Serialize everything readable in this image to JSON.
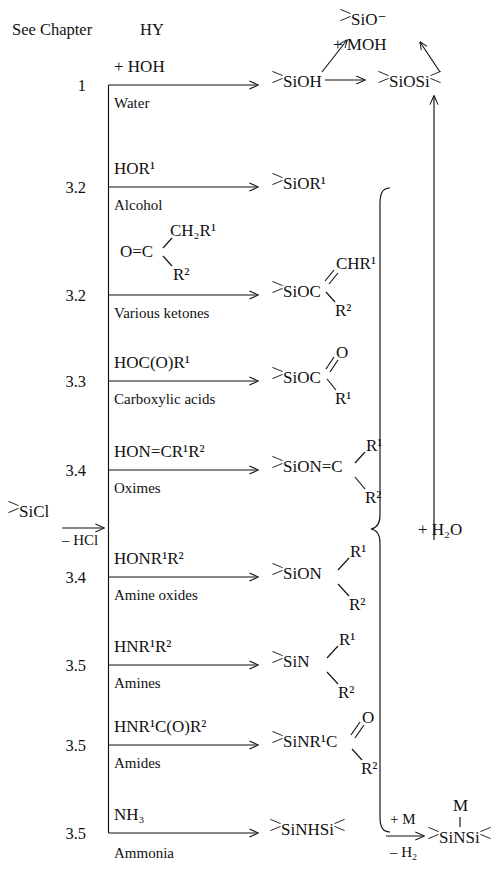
{
  "header": {
    "col_chapter": "See Chapter",
    "col_reagent": "HY"
  },
  "start": {
    "label_prefix": "SiCl",
    "byproduct": "– HCl"
  },
  "rows": [
    {
      "chapter": "1",
      "reagent": "+ HOH",
      "reagent_name": "Water",
      "product": "SiOH"
    },
    {
      "chapter": "3.2",
      "reagent": "HOR¹",
      "reagent_name": "Alcohol",
      "product": "SiOR¹"
    },
    {
      "chapter": "3.2",
      "reagent": "O=C",
      "reagent_top": "CH₂R¹",
      "reagent_bottom": "R²",
      "reagent_name": "Various ketones",
      "product": "SiOC",
      "product_top": "CHR¹",
      "product_bottom": "R²"
    },
    {
      "chapter": "3.3",
      "reagent": "HOC(O)R¹",
      "reagent_name": "Carboxylic acids",
      "product": "SiOC",
      "product_top": "O",
      "product_bottom": "R¹"
    },
    {
      "chapter": "3.4",
      "reagent": "HON=CR¹R²",
      "reagent_name": "Oximes",
      "product": "SiON=C",
      "product_top": "R¹",
      "product_bottom": "R²"
    },
    {
      "chapter": "3.4",
      "reagent": "HONR¹R²",
      "reagent_name": "Amine oxides",
      "product": "SiON",
      "product_top": "R¹",
      "product_bottom": "R²"
    },
    {
      "chapter": "3.5",
      "reagent": "HNR¹R²",
      "reagent_name": "Amines",
      "product": "SiN",
      "product_top": "R¹",
      "product_bottom": "R²"
    },
    {
      "chapter": "3.5",
      "reagent": "HNR¹C(O)R²",
      "reagent_name": "Amides",
      "product": "SiNR¹C",
      "product_top": "O",
      "product_bottom": "R²"
    },
    {
      "chapter": "3.5",
      "reagent": "NH₃",
      "reagent_name": "Ammonia",
      "product": "SiNHSi"
    }
  ],
  "top_chain": {
    "silanol": "SiOH",
    "siloxane": "SiOSi",
    "silanolate": "SiO⁻",
    "base": "+ MOH"
  },
  "brace": {
    "label": "+ H₂O"
  },
  "bottom_chain": {
    "disilazane": "SiNHSi",
    "arrow_top": "+ M",
    "arrow_bottom": "– H₂",
    "metal": "M",
    "product": "SiNSi"
  }
}
